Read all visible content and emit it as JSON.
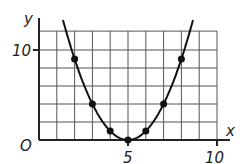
{
  "chart_data": {
    "type": "scatter",
    "title": "",
    "xlabel": "x",
    "ylabel": "y",
    "origin_label": "O",
    "x_ticks": [
      5,
      10
    ],
    "y_ticks": [
      10
    ],
    "xlim": [
      0,
      10
    ],
    "ylim": [
      0,
      12
    ],
    "grid": true,
    "curve": "y = (x - 5)^2",
    "points": [
      {
        "x": 2,
        "y": 9
      },
      {
        "x": 3,
        "y": 4
      },
      {
        "x": 4,
        "y": 1
      },
      {
        "x": 5,
        "y": 0
      },
      {
        "x": 6,
        "y": 1
      },
      {
        "x": 7,
        "y": 4
      },
      {
        "x": 8,
        "y": 9
      }
    ]
  },
  "labels": {
    "x_axis": "x",
    "y_axis": "y",
    "origin": "O",
    "tick_x5": "5",
    "tick_x10": "10",
    "tick_y10": "10"
  }
}
